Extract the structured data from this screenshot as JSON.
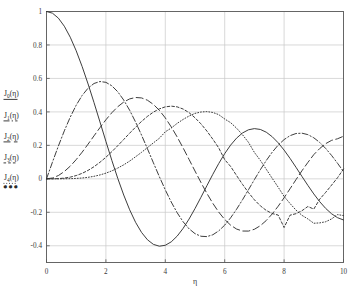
{
  "chart_data": {
    "type": "line",
    "title": "",
    "xlabel": "η",
    "ylabel": "",
    "xlim": [
      0,
      10
    ],
    "ylim": [
      -0.5,
      1.0
    ],
    "xticks": [
      "0",
      "2",
      "4",
      "6",
      "8",
      "10"
    ],
    "xtick_values": [
      0,
      2,
      4,
      6,
      8,
      10
    ],
    "yticks": [
      "1",
      "0.8",
      "0.6",
      "0.4",
      "0.2",
      "0",
      "-0.2",
      "-0.4"
    ],
    "ytick_values": [
      1,
      0.8,
      0.6,
      0.4,
      0.2,
      0,
      -0.2,
      -0.4
    ],
    "grid": true,
    "legend_position": "outside-left",
    "legend": [
      {
        "label": "J",
        "order": "0",
        "arg": "(η)",
        "style": "solid"
      },
      {
        "label": "J",
        "order": "1",
        "arg": "(η)",
        "style": "dash-dot"
      },
      {
        "label": "J",
        "order": "2",
        "arg": "(η)",
        "style": "long-dash"
      },
      {
        "label": "J",
        "order": "3",
        "arg": "(η)",
        "style": "short-dash"
      },
      {
        "label": "J",
        "order": "4",
        "arg": "(η)",
        "style": "dotted"
      }
    ],
    "legend_ellipsis": "●●●",
    "colors": {
      "line": "#333333",
      "grid": "#c8c8c8",
      "frame": "#555555",
      "background": "#ffffff"
    },
    "x": [
      0,
      0.2,
      0.4,
      0.6,
      0.8,
      1.0,
      1.2,
      1.4,
      1.6,
      1.8,
      2.0,
      2.2,
      2.4,
      2.6,
      2.8,
      3.0,
      3.2,
      3.4,
      3.6,
      3.8,
      4.0,
      4.2,
      4.4,
      4.6,
      4.8,
      5.0,
      5.2,
      5.4,
      5.6,
      5.8,
      6.0,
      6.2,
      6.4,
      6.6,
      6.8,
      7.0,
      7.2,
      7.4,
      7.6,
      7.8,
      8.0,
      8.2,
      8.4,
      8.6,
      8.8,
      9.0,
      9.2,
      9.4,
      9.6,
      9.8,
      10.0
    ],
    "series": [
      {
        "name": "J_0(η)",
        "style": "solid",
        "values": [
          1.0,
          0.99,
          0.9604,
          0.912,
          0.8463,
          0.7652,
          0.6711,
          0.5669,
          0.4554,
          0.34,
          0.2239,
          0.1104,
          0.0025,
          -0.0968,
          -0.185,
          -0.2601,
          -0.3202,
          -0.3643,
          -0.3918,
          -0.4026,
          -0.3971,
          -0.3766,
          -0.3423,
          -0.2961,
          -0.2404,
          -0.1776,
          -0.1103,
          -0.0412,
          0.027,
          0.0917,
          0.1506,
          0.2017,
          0.2433,
          0.274,
          0.2931,
          0.3001,
          0.2951,
          0.2786,
          0.2516,
          0.2154,
          0.1717,
          0.1222,
          0.0692,
          0.0146,
          -0.0392,
          -0.0903,
          -0.1367,
          -0.1768,
          -0.209,
          -0.2323,
          -0.2459
        ]
      },
      {
        "name": "J_1(η)",
        "style": "dash-dot",
        "values": [
          0.0,
          0.0995,
          0.196,
          0.2867,
          0.3688,
          0.4401,
          0.4983,
          0.5419,
          0.5699,
          0.5815,
          0.5767,
          0.556,
          0.5202,
          0.4708,
          0.4097,
          0.3391,
          0.2613,
          0.1792,
          0.0955,
          0.0128,
          -0.066,
          -0.1386,
          -0.2028,
          -0.2566,
          -0.2985,
          -0.3276,
          -0.3432,
          -0.3453,
          -0.3343,
          -0.311,
          -0.2767,
          -0.2329,
          -0.1816,
          -0.125,
          -0.0652,
          -0.0047,
          0.0543,
          0.1096,
          0.1592,
          0.2014,
          0.2346,
          0.258,
          0.2708,
          0.2728,
          0.2641,
          0.2453,
          0.2174,
          0.1816,
          0.1395,
          0.0928,
          0.0435
        ]
      },
      {
        "name": "J_2(η)",
        "style": "long-dash",
        "values": [
          0.0,
          0.005,
          0.0197,
          0.0437,
          0.0758,
          0.1149,
          0.1593,
          0.2074,
          0.257,
          0.3061,
          0.3528,
          0.3951,
          0.431,
          0.459,
          0.4777,
          0.4861,
          0.4835,
          0.4697,
          0.4448,
          0.4093,
          0.3641,
          0.3105,
          0.2501,
          0.1846,
          0.1161,
          0.0466,
          -0.0217,
          -0.0867,
          -0.1464,
          -0.199,
          -0.2429,
          -0.2769,
          -0.3001,
          -0.3119,
          -0.3123,
          -0.3014,
          -0.28,
          -0.249,
          -0.2097,
          -0.1638,
          -0.113,
          -0.0594,
          -0.005,
          0.048,
          0.0979,
          0.1448,
          0.1813,
          0.2103,
          0.23,
          0.2395,
          0.2546
        ]
      },
      {
        "name": "J_3(η)",
        "style": "short-dash",
        "values": [
          0.0,
          0.0002,
          0.0013,
          0.0044,
          0.0102,
          0.0196,
          0.0329,
          0.0505,
          0.0725,
          0.0989,
          0.1289,
          0.1623,
          0.1981,
          0.2353,
          0.2727,
          0.3091,
          0.3431,
          0.3734,
          0.3988,
          0.418,
          0.4302,
          0.4344,
          0.4301,
          0.4171,
          0.3955,
          0.3648,
          0.3286,
          0.2855,
          0.237,
          0.1845,
          0.1148,
          0.0738,
          0.0197,
          -0.033,
          -0.0819,
          -0.1254,
          -0.1613,
          -0.1889,
          -0.2075,
          -0.2165,
          -0.2911,
          -0.2172,
          -0.2083,
          -0.1907,
          -0.1654,
          -0.1809,
          -0.1214,
          -0.0809,
          -0.0374,
          0.0069,
          0.0584
        ]
      },
      {
        "name": "J_4(η)",
        "style": "dotted",
        "values": [
          0.0,
          0.0,
          0.0001,
          0.0003,
          0.001,
          0.0025,
          0.005,
          0.0091,
          0.015,
          0.0232,
          0.034,
          0.0476,
          0.0643,
          0.0837,
          0.1061,
          0.132,
          0.1584,
          0.1867,
          0.215,
          0.2425,
          0.2811,
          0.3035,
          0.3316,
          0.355,
          0.3754,
          0.3912,
          0.3993,
          0.4018,
          0.3966,
          0.3837,
          0.3576,
          0.3357,
          0.3027,
          0.2633,
          0.2181,
          0.1578,
          0.1104,
          0.0569,
          0.0031,
          -0.05,
          -0.1054,
          -0.1475,
          -0.1869,
          -0.2179,
          -0.2395,
          -0.2655,
          -0.2633,
          -0.2565,
          -0.2395,
          -0.2136,
          -0.2196
        ]
      }
    ]
  }
}
